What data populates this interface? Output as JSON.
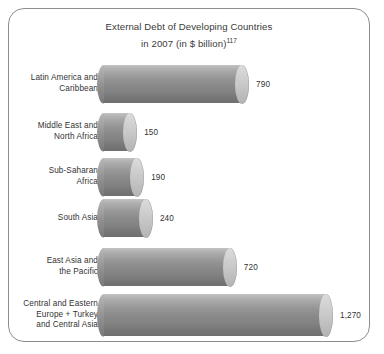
{
  "figure": {
    "border_color": "#8d8d8d",
    "background": "#ffffff"
  },
  "title": {
    "line1": "External Debt of Developing Countries",
    "line2": "in 2007 (in $ billion)",
    "footnote_marker": "117"
  },
  "chart_data": {
    "type": "bar",
    "orientation": "horizontal",
    "xlabel": "",
    "ylabel": "",
    "unit": "$ billion",
    "year": "2007",
    "grid": false,
    "legend": false,
    "xlim": [
      0,
      1270
    ],
    "categories": [
      "Latin America and\nCaribbean",
      "Middle East and\nNorth Africa",
      "Sub-Saharan\nAfrica",
      "South Asia",
      "East Asia and\nthe Pacific",
      "Central and Eastern\nEurope + Turkey\nand Central Asia"
    ],
    "values": [
      790,
      150,
      190,
      240,
      720,
      1270
    ],
    "value_labels": [
      "790",
      "150",
      "190",
      "240",
      "720",
      "1,270"
    ],
    "bar_style": "3d-cylinder",
    "bar_color": "#8a8a8a"
  }
}
